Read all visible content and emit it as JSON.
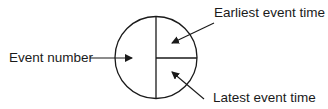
{
  "diagram": {
    "type": "event node notation",
    "node": {
      "shape": "circle",
      "sections": [
        "left half",
        "upper right quadrant",
        "lower right quadrant"
      ]
    },
    "labels": {
      "event_number": "Event number",
      "earliest_event_time": "Earliest event time",
      "latest_event_time": "Latest event time"
    },
    "colors": {
      "stroke": "#1a1a1a",
      "background": "#ffffff"
    }
  }
}
